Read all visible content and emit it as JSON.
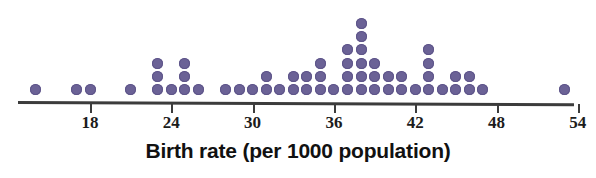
{
  "chart_data": {
    "type": "dotplot",
    "title": "",
    "xlabel": "Birth rate (per 1000 population)",
    "ylabel": "",
    "xlim": [
      12,
      56
    ],
    "grid": false,
    "legend": null,
    "tick_values": [
      18,
      24,
      30,
      36,
      42,
      48,
      54
    ],
    "tick_labels": [
      "18",
      "24",
      "30",
      "36",
      "42",
      "48",
      "54"
    ],
    "dot_color": "#6b6296",
    "axis_color": "#3c3c3c",
    "x": [
      14,
      17,
      18,
      21,
      23,
      24,
      25,
      26,
      28,
      29,
      30,
      31,
      32,
      33,
      34,
      35,
      36,
      37,
      38,
      39,
      40,
      41,
      42,
      43,
      44,
      45,
      46,
      47,
      53
    ],
    "counts": [
      1,
      1,
      1,
      1,
      3,
      1,
      3,
      1,
      1,
      1,
      1,
      2,
      1,
      2,
      2,
      3,
      1,
      4,
      6,
      3,
      2,
      2,
      1,
      4,
      1,
      2,
      2,
      1,
      1
    ],
    "points": [
      {
        "value": 14,
        "count": 1
      },
      {
        "value": 17,
        "count": 1
      },
      {
        "value": 18,
        "count": 1
      },
      {
        "value": 21,
        "count": 1
      },
      {
        "value": 23,
        "count": 3
      },
      {
        "value": 24,
        "count": 1
      },
      {
        "value": 25,
        "count": 3
      },
      {
        "value": 26,
        "count": 1
      },
      {
        "value": 28,
        "count": 1
      },
      {
        "value": 29,
        "count": 1
      },
      {
        "value": 30,
        "count": 1
      },
      {
        "value": 31,
        "count": 2
      },
      {
        "value": 32,
        "count": 1
      },
      {
        "value": 33,
        "count": 2
      },
      {
        "value": 34,
        "count": 2
      },
      {
        "value": 35,
        "count": 3
      },
      {
        "value": 36,
        "count": 1
      },
      {
        "value": 37,
        "count": 4
      },
      {
        "value": 38,
        "count": 6
      },
      {
        "value": 39,
        "count": 3
      },
      {
        "value": 40,
        "count": 2
      },
      {
        "value": 41,
        "count": 2
      },
      {
        "value": 42,
        "count": 1
      },
      {
        "value": 43,
        "count": 4
      },
      {
        "value": 44,
        "count": 1
      },
      {
        "value": 45,
        "count": 2
      },
      {
        "value": 46,
        "count": 2
      },
      {
        "value": 47,
        "count": 1
      },
      {
        "value": 53,
        "count": 1
      }
    ],
    "total_dots": 55,
    "geometry": {
      "origin_x": 90,
      "px_per_unit": 13.55,
      "baseline_y": 95,
      "row_pitch": 13.2,
      "dot_size": 11
    }
  }
}
